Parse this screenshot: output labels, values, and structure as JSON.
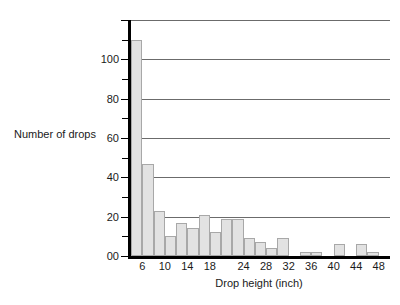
{
  "chart_data": {
    "type": "bar",
    "title": "",
    "xlabel": "Drop height (inch)",
    "ylabel": "Number of drops",
    "categories": [
      "4",
      "6",
      "8",
      "10",
      "12",
      "14",
      "16",
      "18",
      "20",
      "22",
      "24",
      "26",
      "28",
      "30",
      "32",
      "34",
      "36",
      "38",
      "40",
      "42",
      "44",
      "46",
      "48"
    ],
    "values": [
      110,
      47,
      23,
      10,
      17,
      14,
      21,
      12,
      19,
      19,
      9,
      7,
      4,
      9,
      0,
      2,
      2,
      0,
      6,
      0,
      6,
      2,
      0
    ],
    "bin_starts": [
      4,
      6,
      8,
      10,
      12,
      14,
      16,
      18,
      20,
      22,
      24,
      26,
      28,
      30,
      32,
      34,
      36,
      38,
      40,
      42,
      44,
      46,
      48
    ],
    "bin_width": 2,
    "xlim": [
      4,
      50
    ],
    "ylim": [
      0,
      120
    ],
    "grid": true,
    "legend": "none",
    "y_ticks_major": [
      0,
      20,
      40,
      60,
      80,
      100,
      120
    ],
    "y_ticks_minor": [
      10,
      30,
      50,
      70,
      90,
      110
    ],
    "y_tick_labels": [
      "00",
      "20",
      "40",
      "60",
      "80",
      "100"
    ],
    "x_tick_labels": [
      "6",
      "10",
      "14",
      "18",
      "24",
      "28",
      "32",
      "36",
      "40",
      "44",
      "48"
    ],
    "x_tick_values": [
      6,
      10,
      14,
      18,
      24,
      28,
      32,
      36,
      40,
      44,
      48
    ],
    "colors": {
      "bar_fill": "#e2e2e2",
      "bar_edge": "#a8a8a8",
      "axis": "#000000",
      "gridline": "#6b6b6b",
      "text": "#1a1a1a",
      "background": "#ffffff"
    }
  }
}
